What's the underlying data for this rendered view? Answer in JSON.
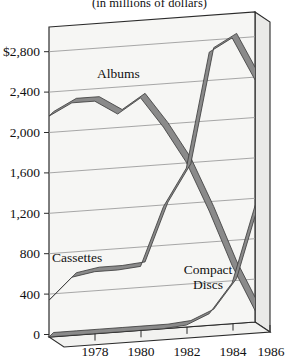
{
  "chart_data": {
    "type": "line",
    "title": "(in millions of dollars)",
    "xlabel": "",
    "ylabel": "",
    "x": [
      1977,
      1978,
      1979,
      1980,
      1981,
      1982,
      1983,
      1984,
      1985,
      1986
    ],
    "xlim": [
      1977,
      1986
    ],
    "ylim": [
      0,
      3200
    ],
    "ytick_labels": [
      "$2,800",
      "2,400",
      "2,000",
      "1,600",
      "1,200",
      "800",
      "400",
      "0"
    ],
    "ytick_values": [
      2800,
      2400,
      2000,
      1600,
      1200,
      800,
      400,
      0
    ],
    "xtick_labels": [
      "1978",
      "1980",
      "1982",
      "1984",
      "1986"
    ],
    "xtick_values": [
      1978,
      1980,
      1982,
      1984,
      1986
    ],
    "grid": true,
    "legend": "inline-labels",
    "style": "3d-ribbon-lines",
    "series": [
      {
        "name": "Albums",
        "label": "Albums",
        "color": "#8a8a8a",
        "values": [
          2280,
          2400,
          2400,
          2250,
          2400,
          2080,
          1700,
          1180,
          600,
          120
        ]
      },
      {
        "name": "Cassettes",
        "label": "Cassettes",
        "color": "#8a8a8a",
        "values": [
          380,
          600,
          640,
          640,
          660,
          1260,
          1640,
          2820,
          2950,
          2500
        ]
      },
      {
        "name": "Compact Discs",
        "label": "Compact\nDiscs",
        "color": "#8a8a8a",
        "values": [
          0,
          0,
          0,
          0,
          0,
          0,
          20,
          120,
          420,
          1200
        ]
      }
    ]
  },
  "labels": {
    "albums": "Albums",
    "cassettes": "Cassettes",
    "compact_line1": "Compact",
    "compact_line2": "Discs"
  },
  "colors": {
    "line": "#8a8a8a",
    "line_edge": "#3f3f3f",
    "grid": "#9a9a9a",
    "axis": "#1a1a1a",
    "panel": "#f4f4f2",
    "panel_side": "#e8e8e6",
    "text": "#111111"
  }
}
